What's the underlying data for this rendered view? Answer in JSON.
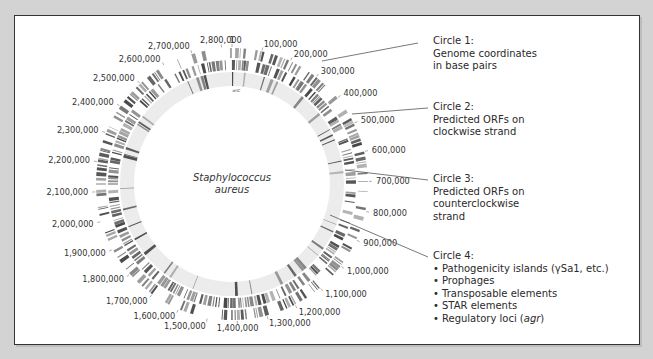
{
  "figure": {
    "species": {
      "line1": "Staphylococcus",
      "line2": "aureus"
    },
    "center": {
      "x": 232,
      "y": 184
    },
    "rings": [
      {
        "name": "circle-1-outer-ring",
        "r_outer": 136,
        "r_inner": 126,
        "density": 0.55,
        "color": "#6a6a6a",
        "seed": 7
      },
      {
        "name": "circle-2-ring",
        "r_outer": 124,
        "r_inner": 114,
        "density": 0.7,
        "color": "#5a5a5a",
        "seed": 19
      },
      {
        "name": "circle-3-ring",
        "r_outer": 112,
        "r_inner": 98,
        "density": 0.18,
        "color": "#9a9a9a",
        "seed": 31,
        "background": "#ececec"
      }
    ],
    "coordinate_ticks": [
      {
        "label": "1",
        "angle": 0
      },
      {
        "label": "100,000",
        "angle": 12.7
      },
      {
        "label": "200,000",
        "angle": 25.4
      },
      {
        "label": "300,000",
        "angle": 38.1
      },
      {
        "label": "400,000",
        "angle": 50.8
      },
      {
        "label": "500,000",
        "angle": 63.5
      },
      {
        "label": "600,000",
        "angle": 76.2
      },
      {
        "label": "700,000",
        "angle": 88.9
      },
      {
        "label": "800,000",
        "angle": 101.6
      },
      {
        "label": "900,000",
        "angle": 114.3
      },
      {
        "label": "1,000,000",
        "angle": 127.0
      },
      {
        "label": "1,100,000",
        "angle": 139.7
      },
      {
        "label": "1,200,000",
        "angle": 152.4
      },
      {
        "label": "1,300,000",
        "angle": 165.1
      },
      {
        "label": "1,400,000",
        "angle": 177.8
      },
      {
        "label": "1,500,000",
        "angle": 190.5
      },
      {
        "label": "1,600,000",
        "angle": 203.2
      },
      {
        "label": "1,700,000",
        "angle": 215.9
      },
      {
        "label": "1,800,000",
        "angle": 228.6
      },
      {
        "label": "1,900,000",
        "angle": 241.3
      },
      {
        "label": "2,000,000",
        "angle": 254.0
      },
      {
        "label": "2,100,000",
        "angle": 266.7
      },
      {
        "label": "2,200,000",
        "angle": 279.4
      },
      {
        "label": "2,300,000",
        "angle": 292.1
      },
      {
        "label": "2,400,000",
        "angle": 304.8
      },
      {
        "label": "2,500,000",
        "angle": 317.5
      },
      {
        "label": "2,600,000",
        "angle": 330.2
      },
      {
        "label": "2,700,000",
        "angle": 342.9
      },
      {
        "label": "2,800,000",
        "angle": 355.6
      }
    ],
    "inner_marker": {
      "label": "oriC",
      "angle": 4
    }
  },
  "legend": {
    "circle1": {
      "title": "Circle 1:",
      "line2": "Genome coordinates",
      "line3": "in base pairs",
      "pointer": {
        "x1": 322,
        "y1": 61,
        "x2": 418,
        "y2": 43
      },
      "pos": {
        "left": 433,
        "top": 35
      }
    },
    "circle2": {
      "title": "Circle 2:",
      "line2": "Predicted ORFs on",
      "line3": "clockwise strand",
      "pointer": {
        "x1": 352,
        "y1": 114,
        "x2": 428,
        "y2": 108
      },
      "pos": {
        "left": 433,
        "top": 101
      }
    },
    "circle3": {
      "title": "Circle 3:",
      "line2": "Predicted ORFs on",
      "line3": "counterclockwise",
      "line4": "strand",
      "pointer": {
        "x1": 345,
        "y1": 170,
        "x2": 428,
        "y2": 180
      },
      "pos": {
        "left": 433,
        "top": 173
      }
    },
    "circle4": {
      "title": "Circle 4:",
      "items": [
        "Pathogenicity islands (γSa1, etc.)",
        "Prophages",
        "Transposable elements",
        "STAR elements",
        "Regulatory loci ("
      ],
      "italic_suffix": "agr",
      "close_paren": ")",
      "pointer": {
        "x1": 330,
        "y1": 215,
        "x2": 428,
        "y2": 257
      },
      "pos": {
        "left": 433,
        "top": 250
      }
    }
  },
  "colors": {
    "background": "#d3d3d3",
    "panel": "#ffffff",
    "border": "#333333",
    "text": "#2a2a2a",
    "pointer_line": "#555555"
  }
}
